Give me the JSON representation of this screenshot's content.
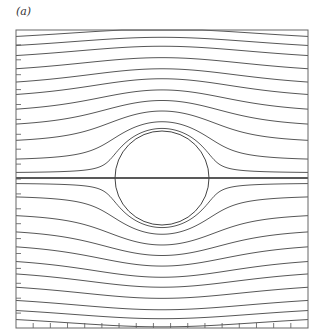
{
  "panel_label": "(a)",
  "chart_data": {
    "type": "streamline",
    "title": "",
    "frame": {
      "left": 16,
      "top": 30,
      "right": 308,
      "bottom": 328
    },
    "cylinder": {
      "cx": 162,
      "cy": 178,
      "r": 47
    },
    "psi_offsets_px": [
      134,
      125,
      115,
      102,
      89,
      77,
      63,
      49,
      34,
      17,
      5,
      0,
      -5,
      -17,
      -34,
      -49,
      -63,
      -77,
      -89,
      -102,
      -115,
      -125,
      -134
    ],
    "bottom_ticks": 17,
    "left_ticks": 20,
    "colors": {
      "line": "#444444",
      "frame": "#666666",
      "background": "#ffffff"
    }
  }
}
